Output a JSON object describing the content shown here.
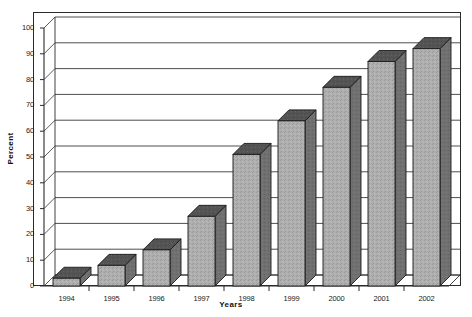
{
  "chart_data": {
    "type": "bar",
    "title": "",
    "subtitle": "",
    "xlabel": "Years",
    "ylabel": "Percent",
    "categories": [
      "1994",
      "1995",
      "1996",
      "1997",
      "1998",
      "1999",
      "2000",
      "2001",
      "2002"
    ],
    "values": [
      3,
      8,
      14,
      27,
      51,
      64,
      77,
      87,
      92
    ],
    "ylim": [
      0,
      100
    ],
    "ytick_labels": [
      "0",
      "10",
      "20",
      "30",
      "40",
      "50",
      "60",
      "70",
      "80",
      "90",
      "100"
    ],
    "ytick_values": [
      0,
      10,
      20,
      30,
      40,
      50,
      60,
      70,
      80,
      90,
      100
    ],
    "grid": true,
    "grid_axis": "y",
    "legend": false,
    "legend_position": "none",
    "style": "3d-extruded-bars",
    "colors": {
      "bar_front": "#a8a8a8",
      "bar_top": "#4f4f4f",
      "bar_side": "#6e6e6e",
      "bar_outline": "#1a1a1a",
      "plot_background": "#ffffff",
      "grid_line": "#3a3a3a",
      "axis_line": "#2b2b2b",
      "text": "#1a1a1a"
    }
  }
}
